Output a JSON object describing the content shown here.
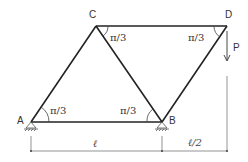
{
  "diagram": {
    "nodes": {
      "A": {
        "label": "A",
        "x": 31,
        "y": 122
      },
      "B": {
        "label": "B",
        "x": 162,
        "y": 122
      },
      "C": {
        "label": "C",
        "x": 96,
        "y": 26
      },
      "D": {
        "label": "D",
        "x": 227,
        "y": 26
      }
    },
    "members": [
      {
        "from": "A",
        "to": "B"
      },
      {
        "from": "A",
        "to": "C"
      },
      {
        "from": "C",
        "to": "B"
      },
      {
        "from": "C",
        "to": "D"
      },
      {
        "from": "D",
        "to": "B"
      }
    ],
    "angles": {
      "at_A": "π/3",
      "at_B": "π/3",
      "at_C": "π/3",
      "at_D": "π/3"
    },
    "load": {
      "label": "P",
      "node": "D",
      "direction": "down"
    },
    "supports": [
      {
        "node": "A",
        "type": "pin"
      },
      {
        "node": "B",
        "type": "pin"
      }
    ],
    "dimensions": {
      "AB": "ℓ",
      "B_to_D": "ℓ/2"
    },
    "colors": {
      "member": "#222222",
      "dimension": "#555555"
    }
  }
}
